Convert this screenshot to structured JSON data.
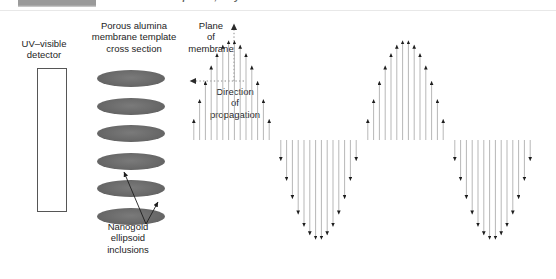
{
  "caption": {
    "partial_text": "are spheres, only one resonance is detected.",
    "gray_block": "redacted-block"
  },
  "labels": {
    "detector": "UV–visible\ndetector",
    "detector_line1": "UV–visible",
    "detector_line2": "detector",
    "template_line1": "Porous alumina",
    "template_line2": "membrane template",
    "template_line3": "cross section",
    "plane_line1": "Plane",
    "plane_line2": "of",
    "plane_line3": "membrane",
    "direction_line1": "Direction",
    "direction_line2": "of",
    "direction_line3": "propagation",
    "nanogold_line1": "Nanogold",
    "nanogold_line2": "ellipsoid",
    "nanogold_line3": "inclusions"
  },
  "colors": {
    "ellipse_fill": "#6d6d6d",
    "stroke": "#1d1d1d",
    "detector_border": "#565656",
    "dotted": "#9a9a9a",
    "caption_block": "#9a9a9a",
    "background": "#ffffff"
  },
  "detector": {
    "x": 37,
    "y": 68,
    "width": 30,
    "height": 144
  },
  "ellipses": {
    "count": 6,
    "width": 68,
    "height": 17,
    "spacing": 27.5,
    "centers_y": [
      8,
      35.5,
      63,
      90.5,
      118,
      145.5
    ]
  },
  "axes": {
    "plane_axis": "vertical-dotted-up-arrow",
    "propagation_axis": "horizontal-dotted-left-arrow",
    "origin_x": 56,
    "origin_y": 61
  },
  "chart_data": {
    "type": "line",
    "xlabel": "Direction of propagation",
    "ylabel": "Field amplitude",
    "waveform": "sine",
    "baseline_y": 114,
    "amplitude": 100,
    "cycles": 2,
    "n_arrows": 61,
    "phase_deg": 180,
    "x_start": 12,
    "x_end": 360,
    "note": "Arrow lengths follow -sin; first half-cycle points down, second half-cycle points up."
  }
}
